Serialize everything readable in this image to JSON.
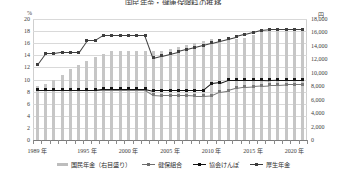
{
  "title": "国民年金・健康保険料の推移",
  "axes": {
    "left_unit": "%",
    "right_unit": "円",
    "left_ticks": [
      "0",
      "2",
      "4",
      "6",
      "8",
      "10",
      "12",
      "14",
      "16",
      "18",
      "20"
    ],
    "right_ticks": [
      "0",
      "2,000",
      "4,000",
      "6,000",
      "8,000",
      "10,000",
      "12,000",
      "14,000",
      "16,000",
      "18,000"
    ],
    "x_labels": [
      "1989 年",
      "1995 年",
      "2000 年",
      "2005 年",
      "2010 年",
      "2015 年",
      "2020 年"
    ]
  },
  "legend": [
    {
      "label": "国民年金（右目盛り）",
      "marker": "bar",
      "color": "#bdbdbd"
    },
    {
      "label": "健保組合",
      "marker": "line-square",
      "color": "#6d6d6d"
    },
    {
      "label": "協会けんぽ",
      "marker": "line-square",
      "color": "#111111"
    },
    {
      "label": "厚生年金",
      "marker": "line-square",
      "color": "#3a3a3a"
    }
  ],
  "chart_data": {
    "type": "line",
    "title": "国民年金・健康保険料の推移",
    "xlabel": "",
    "ylabel": "%",
    "y2label": "円",
    "ylim": [
      0,
      20
    ],
    "y2lim": [
      0,
      18000
    ],
    "grid": true,
    "legend_position": "bottom",
    "x": [
      1989,
      1990,
      1991,
      1992,
      1993,
      1994,
      1995,
      1996,
      1997,
      1998,
      1999,
      2000,
      2001,
      2002,
      2003,
      2004,
      2005,
      2006,
      2007,
      2008,
      2009,
      2010,
      2011,
      2012,
      2013,
      2014,
      2015,
      2016,
      2017,
      2018,
      2019,
      2020,
      2021
    ],
    "series": [
      {
        "name": "国民年金（右目盛り）",
        "type": "bar",
        "axis": "right",
        "unit": "円",
        "values": [
          8000,
          8400,
          9000,
          9700,
          10500,
          11100,
          11700,
          12300,
          12800,
          13300,
          13300,
          13300,
          13300,
          13300,
          13300,
          13300,
          13580,
          13860,
          14140,
          14410,
          14660,
          15100,
          15020,
          14980,
          15040,
          15250,
          15590,
          16260,
          16490,
          16340,
          16410,
          16540,
          16610
        ]
      },
      {
        "name": "健保組合",
        "type": "line",
        "axis": "left",
        "unit": "%",
        "values": [
          8.3,
          8.3,
          8.3,
          8.3,
          8.3,
          8.3,
          8.3,
          8.3,
          8.3,
          8.3,
          8.3,
          8.3,
          8.3,
          8.3,
          7.5,
          7.4,
          7.4,
          7.4,
          7.4,
          7.3,
          7.3,
          7.4,
          8.0,
          8.2,
          8.6,
          8.8,
          8.9,
          9.0,
          9.1,
          9.1,
          9.2,
          9.2,
          9.2
        ]
      },
      {
        "name": "協会けんぽ",
        "type": "line",
        "axis": "left",
        "unit": "%",
        "values": [
          8.3,
          8.3,
          8.3,
          8.3,
          8.3,
          8.3,
          8.3,
          8.3,
          8.5,
          8.5,
          8.5,
          8.5,
          8.5,
          8.5,
          8.2,
          8.2,
          8.2,
          8.2,
          8.2,
          8.2,
          8.2,
          9.34,
          9.5,
          10.0,
          10.0,
          10.0,
          10.0,
          10.0,
          9.97,
          10.0,
          10.0,
          10.0,
          10.0
        ]
      },
      {
        "name": "厚生年金",
        "type": "line",
        "axis": "left",
        "unit": "%",
        "values": [
          12.4,
          14.3,
          14.3,
          14.5,
          14.5,
          14.5,
          16.5,
          16.5,
          17.35,
          17.35,
          17.35,
          17.35,
          17.35,
          17.35,
          13.58,
          13.93,
          14.29,
          14.64,
          14.99,
          15.35,
          15.7,
          16.06,
          16.41,
          16.77,
          17.12,
          17.47,
          17.83,
          18.18,
          18.3,
          18.3,
          18.3,
          18.3,
          18.3
        ]
      }
    ]
  }
}
